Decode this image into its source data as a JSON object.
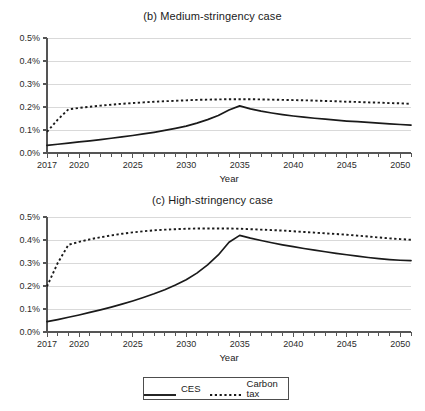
{
  "figure": {
    "axis_title": "Year",
    "legend": {
      "items": [
        {
          "label": "CES",
          "style": "solid",
          "color": "#1a1a1a",
          "icon": "solid-line-swatch"
        },
        {
          "label": "Carbon tax",
          "style": "dotted",
          "color": "#1a1a1a",
          "icon": "dotted-line-swatch"
        }
      ]
    },
    "colors": {
      "line": "#1a1a1a",
      "axis": "#555555",
      "grid": "#d9d9d9",
      "text": "#1a1a1a",
      "background": "#ffffff"
    }
  },
  "chart_data": [
    {
      "type": "line",
      "title": "(b) Medium-stringency case",
      "xlabel": "Year",
      "ylabel": "",
      "xlim": [
        2017,
        2051
      ],
      "ylim": [
        0.0,
        0.5
      ],
      "grid": true,
      "legend_position": "bottom-shared",
      "ytick_labels": [
        "0.0%",
        "0.1%",
        "0.2%",
        "0.3%",
        "0.4%",
        "0.5%"
      ],
      "ytick_values": [
        0.0,
        0.1,
        0.2,
        0.3,
        0.4,
        0.5
      ],
      "xtick_labels": [
        "2017",
        "2020",
        "2025",
        "2030",
        "2035",
        "2040",
        "2045",
        "2050"
      ],
      "xtick_values": [
        2017,
        2020,
        2025,
        2030,
        2035,
        2040,
        2045,
        2050
      ],
      "x": [
        2017,
        2018,
        2019,
        2020,
        2021,
        2022,
        2023,
        2024,
        2025,
        2026,
        2027,
        2028,
        2029,
        2030,
        2031,
        2032,
        2033,
        2034,
        2035,
        2036,
        2037,
        2038,
        2039,
        2040,
        2041,
        2042,
        2043,
        2044,
        2045,
        2046,
        2047,
        2048,
        2049,
        2050,
        2051
      ],
      "series": [
        {
          "name": "CES",
          "style": "solid",
          "values": [
            0.033,
            0.038,
            0.043,
            0.048,
            0.053,
            0.058,
            0.064,
            0.07,
            0.076,
            0.083,
            0.09,
            0.098,
            0.107,
            0.117,
            0.13,
            0.145,
            0.163,
            0.187,
            0.205,
            0.192,
            0.182,
            0.174,
            0.167,
            0.161,
            0.156,
            0.151,
            0.147,
            0.143,
            0.139,
            0.136,
            0.133,
            0.13,
            0.127,
            0.124,
            0.121
          ]
        },
        {
          "name": "Carbon tax",
          "style": "dotted",
          "values": [
            0.092,
            0.145,
            0.19,
            0.196,
            0.201,
            0.206,
            0.21,
            0.214,
            0.217,
            0.22,
            0.223,
            0.225,
            0.227,
            0.229,
            0.231,
            0.232,
            0.233,
            0.234,
            0.234,
            0.234,
            0.233,
            0.232,
            0.231,
            0.23,
            0.229,
            0.228,
            0.226,
            0.225,
            0.223,
            0.222,
            0.22,
            0.219,
            0.217,
            0.216,
            0.214
          ]
        }
      ]
    },
    {
      "type": "line",
      "title": "(c) High-stringency case",
      "xlabel": "Year",
      "ylabel": "",
      "xlim": [
        2017,
        2051
      ],
      "ylim": [
        0.0,
        0.5
      ],
      "grid": true,
      "legend_position": "bottom-shared",
      "ytick_labels": [
        "0.0%",
        "0.1%",
        "0.2%",
        "0.3%",
        "0.4%",
        "0.5%"
      ],
      "ytick_values": [
        0.0,
        0.1,
        0.2,
        0.3,
        0.4,
        0.5
      ],
      "xtick_labels": [
        "2017",
        "2020",
        "2025",
        "2030",
        "2035",
        "2040",
        "2045",
        "2050"
      ],
      "xtick_values": [
        2017,
        2020,
        2025,
        2030,
        2035,
        2040,
        2045,
        2050
      ],
      "x": [
        2017,
        2018,
        2019,
        2020,
        2021,
        2022,
        2023,
        2024,
        2025,
        2026,
        2027,
        2028,
        2029,
        2030,
        2031,
        2032,
        2033,
        2034,
        2035,
        2036,
        2037,
        2038,
        2039,
        2040,
        2041,
        2042,
        2043,
        2044,
        2045,
        2046,
        2047,
        2048,
        2049,
        2050,
        2051
      ],
      "series": [
        {
          "name": "CES",
          "style": "solid",
          "values": [
            0.045,
            0.054,
            0.064,
            0.074,
            0.085,
            0.096,
            0.108,
            0.121,
            0.135,
            0.15,
            0.166,
            0.184,
            0.204,
            0.227,
            0.256,
            0.292,
            0.335,
            0.39,
            0.42,
            0.408,
            0.398,
            0.388,
            0.379,
            0.371,
            0.363,
            0.356,
            0.349,
            0.342,
            0.336,
            0.33,
            0.324,
            0.319,
            0.315,
            0.312,
            0.31
          ]
        },
        {
          "name": "Carbon tax",
          "style": "dotted",
          "values": [
            0.198,
            0.3,
            0.379,
            0.392,
            0.403,
            0.412,
            0.42,
            0.427,
            0.433,
            0.438,
            0.442,
            0.445,
            0.447,
            0.449,
            0.45,
            0.45,
            0.45,
            0.45,
            0.449,
            0.447,
            0.445,
            0.443,
            0.441,
            0.438,
            0.435,
            0.432,
            0.429,
            0.426,
            0.423,
            0.419,
            0.415,
            0.411,
            0.407,
            0.404,
            0.401
          ]
        }
      ]
    }
  ]
}
